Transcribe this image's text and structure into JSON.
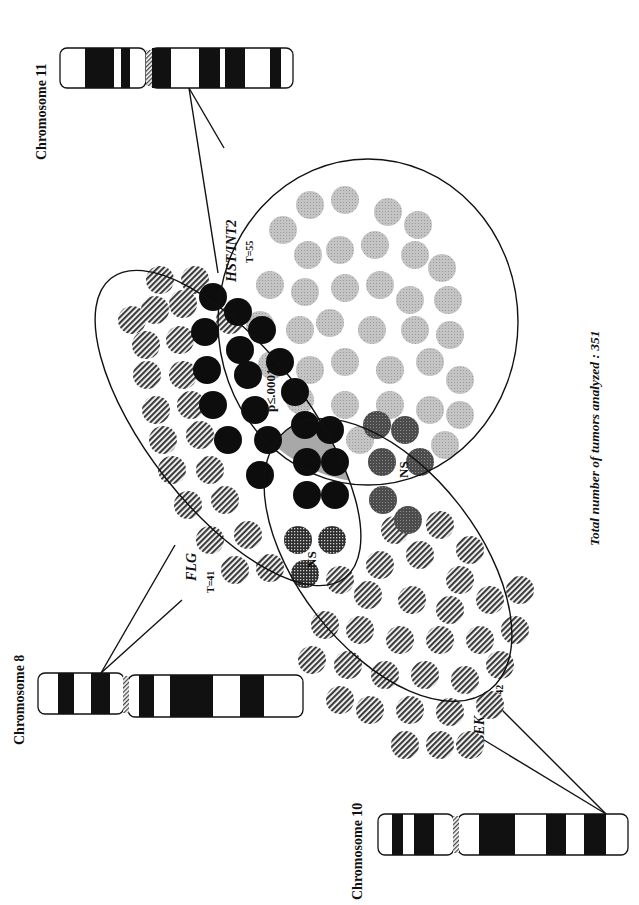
{
  "figure": {
    "total_label": "Total number of tumors analyzed : 351",
    "colors": {
      "ink": "#111111",
      "hst_only": "#b9b9b9",
      "hst_flg": "#0d0d0d",
      "hst_bek": "#4a4a4a",
      "triple": "#0d0d0d",
      "triple_bg": "#a8a8a8",
      "flg_bek": "#3a3a3a",
      "hatch": "#3c3c3c",
      "band": "#111111",
      "centromere": "#555555"
    }
  },
  "chromosomes": [
    {
      "id": "chr11",
      "label": "Chromosome 11"
    },
    {
      "id": "chr8",
      "label": "Chromosome 8"
    },
    {
      "id": "chr10",
      "label": "Chromosome 10"
    }
  ],
  "genes": [
    {
      "id": "hst",
      "name": "HST/INT2",
      "tumors": "T=55",
      "chromosome": "Chromosome 11"
    },
    {
      "id": "flg",
      "name": "FLG",
      "tumors": "T=41",
      "chromosome": "Chromosome 8"
    },
    {
      "id": "bek",
      "name": "BEK",
      "tumors": "T=42",
      "chromosome": "Chromosome 10"
    }
  ],
  "regions": [
    {
      "id": "hst_only",
      "sets": [
        "HST/INT2"
      ],
      "count": 35,
      "pattern": "light-stipple"
    },
    {
      "id": "flg_only",
      "sets": [
        "FLG"
      ],
      "count": 22,
      "pattern": "hatched"
    },
    {
      "id": "bek_only",
      "sets": [
        "BEK"
      ],
      "count": 32,
      "pattern": "hatched"
    },
    {
      "id": "hst_flg",
      "sets": [
        "HST/INT2",
        "FLG"
      ],
      "count": 15,
      "pattern": "solid-black",
      "stat": "p≤.0001"
    },
    {
      "id": "hst_bek",
      "sets": [
        "HST/INT2",
        "BEK"
      ],
      "count": 6,
      "pattern": "dark-stipple",
      "stat": "NS"
    },
    {
      "id": "flg_bek",
      "sets": [
        "FLG",
        "BEK"
      ],
      "count": 3,
      "pattern": "crosshatch",
      "stat": "NS"
    },
    {
      "id": "triple",
      "sets": [
        "HST/INT2",
        "FLG",
        "BEK"
      ],
      "count": 5,
      "pattern": "solid-black-on-gray"
    }
  ]
}
